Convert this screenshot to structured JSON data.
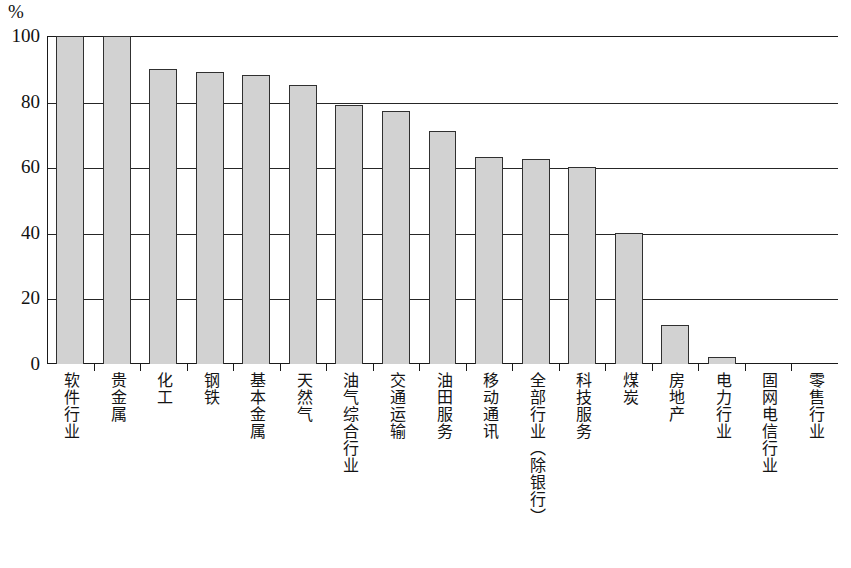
{
  "chart": {
    "unit_label": "%",
    "y_axis": {
      "ticks": [
        "0",
        "20",
        "40",
        "60",
        "80",
        "100"
      ],
      "min": 0,
      "max": 100
    }
  },
  "chart_data": {
    "type": "bar",
    "title": "",
    "xlabel": "",
    "ylabel": "%",
    "ylim": [
      0,
      100
    ],
    "yticks": [
      0,
      20,
      40,
      60,
      80,
      100
    ],
    "grid": "horizontal",
    "legend": "none",
    "categories": [
      "软件行业",
      "贵金属",
      "化工",
      "钢铁",
      "基本金属",
      "天然气",
      "油气综合行业",
      "交通运输",
      "油田服务",
      "移动通讯",
      "全部行业（除银行）",
      "科技服务",
      "煤炭",
      "房地产",
      "电力行业",
      "固网电信行业",
      "零售行业"
    ],
    "values": [
      100,
      100,
      90,
      89,
      88,
      85,
      79,
      77,
      71,
      63,
      62.5,
      60,
      40,
      12,
      2,
      0,
      0
    ],
    "bar_fill_color": "#d2d2d2",
    "bar_edge_color": "#303030"
  }
}
